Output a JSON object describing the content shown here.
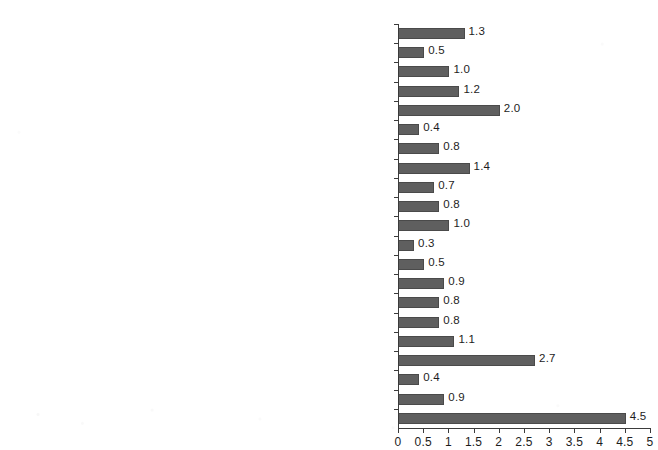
{
  "chart_data": {
    "type": "bar",
    "orientation": "horizontal",
    "title": "",
    "xlabel": "",
    "ylabel": "",
    "xlim": [
      0,
      5
    ],
    "xticks": [
      "0",
      "0.5",
      "1",
      "1.5",
      "2",
      "2.5",
      "3",
      "3.5",
      "4",
      "4.5",
      "5"
    ],
    "xtick_values": [
      0,
      0.5,
      1,
      1.5,
      2,
      2.5,
      3,
      3.5,
      4,
      4.5,
      5
    ],
    "grid": false,
    "legend": null,
    "bar_color": "#5f5f5f",
    "axis_color": "#3b3b3b",
    "categories": [
      "Unclassified",
      "Public Administration",
      "Other Services",
      "Accommodation and Food Services",
      "Arts, Entertainment, and Recreation",
      "Healthcare and Social Assistance",
      "Educational Services",
      "Administrative Support, Waste Management, and Remediation Services",
      "Management of Companies and Enterprises",
      "Professional, Scientific, and Technical Services",
      "Real Estate and Rental and Leasing",
      "Finance and Insurance",
      "Information and Cultural Industries",
      "Transportation and Warehousing",
      "Retail Trade",
      "Wholesale Trade",
      "Manufacturing",
      "Construction",
      "Utilities",
      "Mining and Oil and Gas Extraction",
      "Agriculture, Forestry, Fishing, and Hunting"
    ],
    "values": [
      1.3,
      0.5,
      1.0,
      1.2,
      2.0,
      0.4,
      0.8,
      1.4,
      0.7,
      0.8,
      1.0,
      0.3,
      0.5,
      0.9,
      0.8,
      0.8,
      1.1,
      2.7,
      0.4,
      0.9,
      4.5
    ],
    "value_labels": [
      "1.3",
      "0.5",
      "1.0",
      "1.2",
      "2.0",
      "0.4",
      "0.8",
      "1.4",
      "0.7",
      "0.8",
      "1.0",
      "0.3",
      "0.5",
      "0.9",
      "0.8",
      "0.8",
      "1.1",
      "2.7",
      "0.4",
      "0.9",
      "4.5"
    ]
  }
}
